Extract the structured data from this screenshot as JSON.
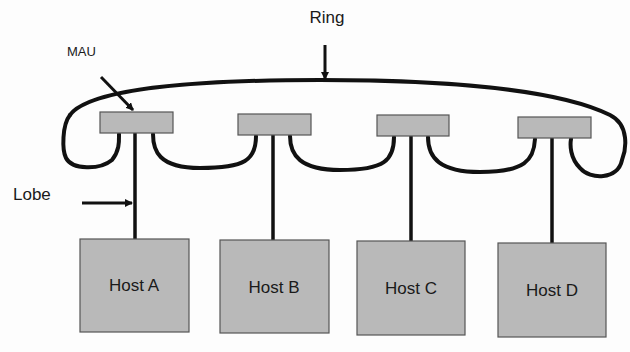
{
  "diagram": {
    "type": "token-ring-topology",
    "labels": {
      "ring": "Ring",
      "mau": "MAU",
      "lobe": "Lobe"
    },
    "hosts": [
      {
        "id": "A",
        "label": "Host A"
      },
      {
        "id": "B",
        "label": "Host B"
      },
      {
        "id": "C",
        "label": "Host C"
      },
      {
        "id": "D",
        "label": "Host D"
      }
    ],
    "colors": {
      "box_fill": "#b9b9b9",
      "box_stroke": "#555555",
      "line": "#111111",
      "background": "#fdfdfd"
    }
  }
}
